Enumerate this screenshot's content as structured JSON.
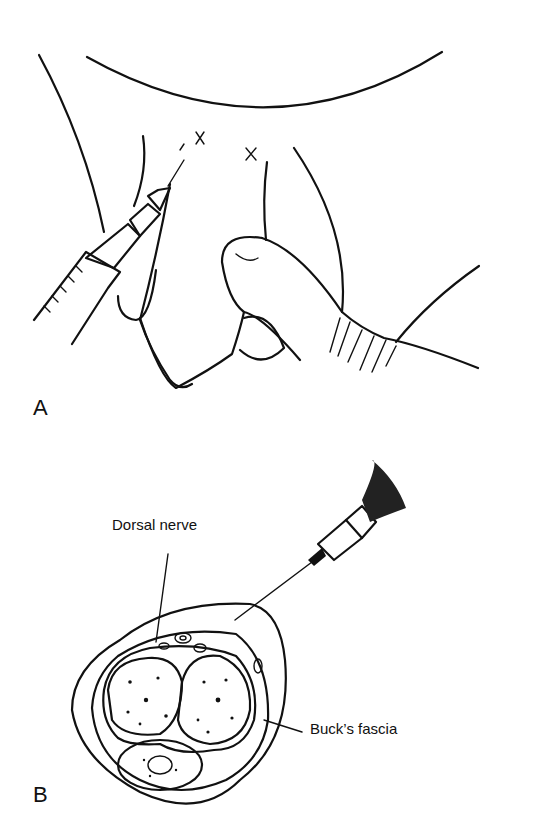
{
  "figure": {
    "panels": [
      {
        "id": "A",
        "label": "A",
        "description": "Line drawing of injection sites marked with two x marks at the base, syringe inserted at left, thumb holding structure"
      },
      {
        "id": "B",
        "label": "B",
        "description": "Cross-section with syringe needle inserted beneath Buck's fascia",
        "callouts": [
          {
            "text": "Dorsal nerve"
          },
          {
            "text": "Buck’s fascia"
          }
        ]
      }
    ],
    "markers": [
      "x",
      "x"
    ]
  }
}
